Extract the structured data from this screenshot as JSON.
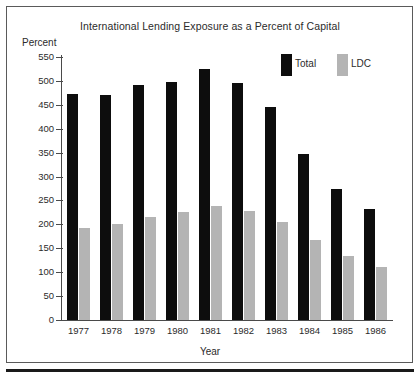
{
  "chart_data": {
    "type": "bar",
    "title": "International Lending Exposure as a Percent of Capital",
    "xlabel": "Year",
    "ylabel": "Percent",
    "categories": [
      "1977",
      "1978",
      "1979",
      "1980",
      "1981",
      "1982",
      "1983",
      "1984",
      "1985",
      "1986"
    ],
    "series": [
      {
        "name": "Total",
        "color": "#0d0d0d",
        "values": [
          472,
          470,
          492,
          497,
          525,
          495,
          445,
          347,
          273,
          232
        ]
      },
      {
        "name": "LDC",
        "color": "#b4b4b4",
        "values": [
          193,
          200,
          215,
          225,
          238,
          228,
          205,
          167,
          133,
          110
        ]
      }
    ],
    "ylim": [
      0,
      550
    ],
    "ytick_values": [
      0,
      50,
      100,
      150,
      200,
      250,
      300,
      350,
      400,
      450,
      500,
      550
    ],
    "ytick_labels": [
      "0",
      "50",
      "100",
      "150",
      "200",
      "250",
      "300",
      "350",
      "400",
      "450",
      "500",
      "550"
    ],
    "grid": false,
    "legend_position": "upper-right-inside"
  },
  "legend": {
    "items": [
      {
        "label": "Total",
        "color": "#0d0d0d"
      },
      {
        "label": "LDC",
        "color": "#b4b4b4"
      }
    ]
  }
}
